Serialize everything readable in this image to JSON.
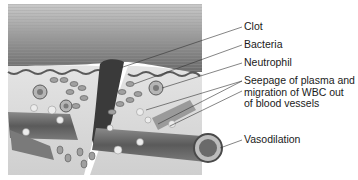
{
  "diagram": {
    "type": "labeled-illustration",
    "labels": [
      {
        "id": "clot",
        "text": "Clot"
      },
      {
        "id": "bacteria",
        "text": "Bacteria"
      },
      {
        "id": "neutrophil",
        "text": "Neutrophil"
      },
      {
        "id": "seepage",
        "lines": [
          "Seepage of plasma and",
          "migration of WBC out",
          "of blood vessels"
        ]
      },
      {
        "id": "vasodilation",
        "text": "Vasodilation"
      }
    ],
    "colors": {
      "background": "#ffffff",
      "text": "#1a1a1a",
      "leader_line": "#333333",
      "tissue_dark": "#6e6e6e",
      "tissue_light": "#d8d8d8",
      "clot": "#3a3a3a"
    }
  }
}
